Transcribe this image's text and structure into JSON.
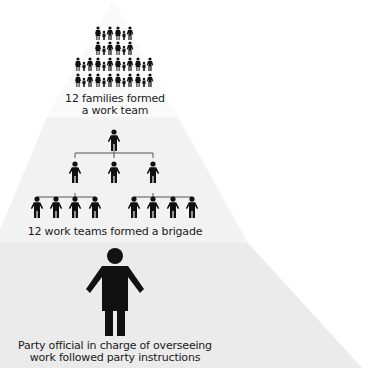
{
  "diagram": {
    "type": "pyramid-hierarchy",
    "tiers": [
      {
        "id": "families",
        "caption_line1": "12 families formed",
        "caption_line2": "a work team",
        "icon": "family-icon",
        "icon_count": 12,
        "icon_rows": [
          2,
          2,
          4,
          4
        ],
        "fill": "#fafafa"
      },
      {
        "id": "work-teams",
        "caption": "12 work teams formed a brigade",
        "icon": "person-icon",
        "org_chart": {
          "top": 1,
          "middle": 3,
          "bottom_groups": [
            4,
            4
          ]
        },
        "fill": "#f2f2f2"
      },
      {
        "id": "party-official",
        "caption_line1": "Party official in charge of overseeing",
        "caption_line2": "work followed party instructions",
        "icon": "person-icon-large",
        "icon_count": 1,
        "fill": "#ebebeb"
      }
    ],
    "colors": {
      "icon": "#111111",
      "connector": "#555555",
      "text": "#1a1a1a",
      "background": "#ffffff"
    }
  }
}
